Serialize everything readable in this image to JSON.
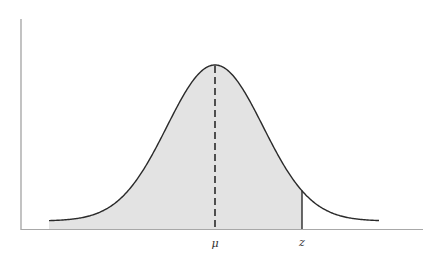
{
  "diagram": {
    "type": "normal-distribution-shaded-cdf",
    "labels": {
      "mean": "μ",
      "z": "z"
    },
    "colors": {
      "curve": "#2a2a2a",
      "fill": "#e3e3e3",
      "axis": "#9a9a9a",
      "mean_line": "#2a2a2a",
      "z_line": "#2a2a2a"
    }
  }
}
